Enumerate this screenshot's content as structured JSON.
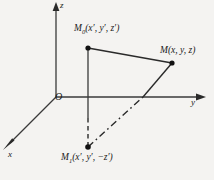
{
  "figure": {
    "background_color": "#f4f3f1",
    "line_color": "#1a1a1a"
  },
  "axes": {
    "z_label": "z",
    "y_label": "y",
    "x_label": "x",
    "origin_label": "O"
  },
  "points": {
    "m0": {
      "name": "M",
      "subscript": "0",
      "coords": "(x′, y′, z′)",
      "label": "M0(x′, y′, z′)"
    },
    "m": {
      "name": "M",
      "subscript": "",
      "coords": "(x, y, z)",
      "label": "M(x, y, z)"
    },
    "m1": {
      "name": "M",
      "subscript": "1",
      "coords": "(x′, y′, −z′)",
      "label": "M1(x′, y′, −z′)"
    }
  },
  "geometry": {
    "origin": [
      56,
      97
    ],
    "z_axis_tip": [
      56,
      3
    ],
    "y_axis_tip": [
      206,
      97
    ],
    "x_axis_tip": [
      3,
      148
    ],
    "m0_point": [
      88,
      48
    ],
    "m_point": [
      172,
      63
    ],
    "m1_point": [
      88,
      147
    ],
    "vertical_solid_end": [
      88,
      118
    ],
    "diagonal_cross": [
      143,
      97
    ]
  }
}
